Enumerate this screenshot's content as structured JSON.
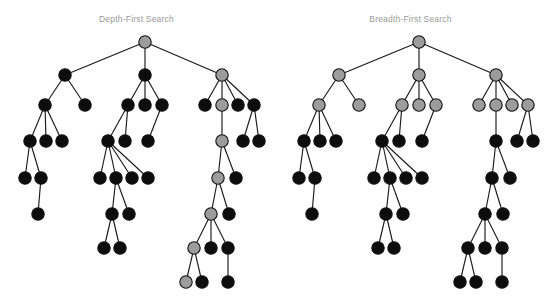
{
  "figure": {
    "kind": "tree-traversal-diagram",
    "background_color": "#ffffff",
    "node_colors": {
      "visited_gray": "#9c9c9c",
      "unvisited_black": "#0d0d0d",
      "node_stroke": "#111111",
      "edge": "#1a1a1a"
    },
    "title_color": "#9a9a9a",
    "node_radius": 6.2
  },
  "panels": [
    {
      "id": "dfs",
      "title": "Depth-First Search",
      "highlight_rule": "single deep path from root",
      "gray_node_ids": [
        "r",
        "c3",
        "c3b",
        "c3b1",
        "c3b1a",
        "c3b1a1",
        "c3b1a1a",
        "c3b1a1a1"
      ],
      "counts": {
        "nodes": 40,
        "gray": 8,
        "black": 32
      }
    },
    {
      "id": "bfs",
      "title": "Breadth-First Search",
      "highlight_rule": "all nodes at depth 0, 1 and 2",
      "gray_node_ids": [
        "r",
        "c1",
        "c2",
        "c3",
        "c1a",
        "c1b",
        "c2a",
        "c2b",
        "c2c",
        "c3a",
        "c3b",
        "c3c",
        "c3d"
      ],
      "counts": {
        "nodes": 40,
        "gray": 13,
        "black": 27
      }
    }
  ],
  "tree": {
    "nodes": [
      {
        "id": "r",
        "x": 145,
        "y": 42,
        "depth": 0
      },
      {
        "id": "c1",
        "x": 65,
        "y": 75,
        "depth": 1
      },
      {
        "id": "c2",
        "x": 145,
        "y": 75,
        "depth": 1
      },
      {
        "id": "c3",
        "x": 222,
        "y": 75,
        "depth": 1
      },
      {
        "id": "c1a",
        "x": 45,
        "y": 105,
        "depth": 2
      },
      {
        "id": "c1b",
        "x": 85,
        "y": 105,
        "depth": 2
      },
      {
        "id": "c2a",
        "x": 128,
        "y": 105,
        "depth": 2
      },
      {
        "id": "c2b",
        "x": 145,
        "y": 105,
        "depth": 2
      },
      {
        "id": "c2c",
        "x": 162,
        "y": 105,
        "depth": 2
      },
      {
        "id": "c3a",
        "x": 205,
        "y": 105,
        "depth": 2
      },
      {
        "id": "c3b",
        "x": 222,
        "y": 105,
        "depth": 2
      },
      {
        "id": "c3c",
        "x": 238,
        "y": 105,
        "depth": 2
      },
      {
        "id": "c3d",
        "x": 254,
        "y": 105,
        "depth": 2
      },
      {
        "id": "c1a1",
        "x": 30,
        "y": 141,
        "depth": 3
      },
      {
        "id": "c1a2",
        "x": 46,
        "y": 141,
        "depth": 3
      },
      {
        "id": "c1a3",
        "x": 62,
        "y": 141,
        "depth": 3
      },
      {
        "id": "c2a1",
        "x": 108,
        "y": 141,
        "depth": 3
      },
      {
        "id": "c2a2",
        "x": 125,
        "y": 141,
        "depth": 3
      },
      {
        "id": "c2c1",
        "x": 148,
        "y": 141,
        "depth": 3
      },
      {
        "id": "c3b1",
        "x": 222,
        "y": 141,
        "depth": 3
      },
      {
        "id": "c3d1",
        "x": 243,
        "y": 141,
        "depth": 3
      },
      {
        "id": "c3d2",
        "x": 259,
        "y": 141,
        "depth": 3
      },
      {
        "id": "c1a1a",
        "x": 25,
        "y": 178,
        "depth": 4
      },
      {
        "id": "c1a1b",
        "x": 41,
        "y": 178,
        "depth": 4
      },
      {
        "id": "c2a1a",
        "x": 100,
        "y": 178,
        "depth": 4
      },
      {
        "id": "c2a1b",
        "x": 116,
        "y": 178,
        "depth": 4
      },
      {
        "id": "c2a1c",
        "x": 132,
        "y": 178,
        "depth": 4
      },
      {
        "id": "c2a1d",
        "x": 148,
        "y": 178,
        "depth": 4
      },
      {
        "id": "c3b1a",
        "x": 218,
        "y": 178,
        "depth": 4
      },
      {
        "id": "c3b1b",
        "x": 236,
        "y": 178,
        "depth": 4
      },
      {
        "id": "c1a1b1",
        "x": 38,
        "y": 214,
        "depth": 5
      },
      {
        "id": "c2a1b1",
        "x": 112,
        "y": 214,
        "depth": 5
      },
      {
        "id": "c2a1b2",
        "x": 129,
        "y": 214,
        "depth": 5
      },
      {
        "id": "c3b1a1",
        "x": 211,
        "y": 214,
        "depth": 5
      },
      {
        "id": "c3b1a2",
        "x": 229,
        "y": 214,
        "depth": 5
      },
      {
        "id": "c2a1b1a",
        "x": 104,
        "y": 248,
        "depth": 6
      },
      {
        "id": "c2a1b1b",
        "x": 120,
        "y": 248,
        "depth": 6
      },
      {
        "id": "c3b1a1a",
        "x": 194,
        "y": 248,
        "depth": 6
      },
      {
        "id": "c3b1a1b",
        "x": 211,
        "y": 248,
        "depth": 6
      },
      {
        "id": "c3b1a1c",
        "x": 228,
        "y": 248,
        "depth": 6
      },
      {
        "id": "c3b1a1a1",
        "x": 186,
        "y": 282,
        "depth": 7
      },
      {
        "id": "c3b1a1a2",
        "x": 202,
        "y": 282,
        "depth": 7
      },
      {
        "id": "c3b1a1c1",
        "x": 228,
        "y": 282,
        "depth": 7
      }
    ],
    "edges": [
      [
        "r",
        "c1"
      ],
      [
        "r",
        "c2"
      ],
      [
        "r",
        "c3"
      ],
      [
        "c1",
        "c1a"
      ],
      [
        "c1",
        "c1b"
      ],
      [
        "c2",
        "c2a"
      ],
      [
        "c2",
        "c2b"
      ],
      [
        "c2",
        "c2c"
      ],
      [
        "c3",
        "c3a"
      ],
      [
        "c3",
        "c3b"
      ],
      [
        "c3",
        "c3c"
      ],
      [
        "c3",
        "c3d"
      ],
      [
        "c1a",
        "c1a1"
      ],
      [
        "c1a",
        "c1a2"
      ],
      [
        "c1a",
        "c1a3"
      ],
      [
        "c2a",
        "c2a1"
      ],
      [
        "c2a",
        "c2a2"
      ],
      [
        "c2c",
        "c2c1"
      ],
      [
        "c3b",
        "c3b1"
      ],
      [
        "c3d",
        "c3d1"
      ],
      [
        "c3d",
        "c3d2"
      ],
      [
        "c1a1",
        "c1a1a"
      ],
      [
        "c1a1",
        "c1a1b"
      ],
      [
        "c2a1",
        "c2a1a"
      ],
      [
        "c2a1",
        "c2a1b"
      ],
      [
        "c2a1",
        "c2a1c"
      ],
      [
        "c2a1",
        "c2a1d"
      ],
      [
        "c3b1",
        "c3b1a"
      ],
      [
        "c3b1",
        "c3b1b"
      ],
      [
        "c1a1b",
        "c1a1b1"
      ],
      [
        "c2a1b",
        "c2a1b1"
      ],
      [
        "c2a1b",
        "c2a1b2"
      ],
      [
        "c3b1a",
        "c3b1a1"
      ],
      [
        "c3b1a",
        "c3b1a2"
      ],
      [
        "c2a1b1",
        "c2a1b1a"
      ],
      [
        "c2a1b1",
        "c2a1b1b"
      ],
      [
        "c3b1a1",
        "c3b1a1a"
      ],
      [
        "c3b1a1",
        "c3b1a1b"
      ],
      [
        "c3b1a1",
        "c3b1a1c"
      ],
      [
        "c3b1a1a",
        "c3b1a1a1"
      ],
      [
        "c3b1a1a",
        "c3b1a1a2"
      ],
      [
        "c3b1a1c",
        "c3b1a1c1"
      ]
    ]
  },
  "chart_data": {
    "type": "diagram",
    "subtitle": "",
    "xlabel": "",
    "ylabel": "",
    "legend": [
      {
        "label": "visited / expanded",
        "color": "#9c9c9c"
      },
      {
        "label": "not yet visited",
        "color": "#0d0d0d"
      }
    ],
    "series": [
      {
        "name": "Depth-First Search",
        "visited_nodes": 8,
        "total_nodes": 40,
        "max_depth_reached": 7
      },
      {
        "name": "Breadth-First Search",
        "visited_nodes": 13,
        "total_nodes": 40,
        "max_depth_reached": 2
      }
    ]
  }
}
